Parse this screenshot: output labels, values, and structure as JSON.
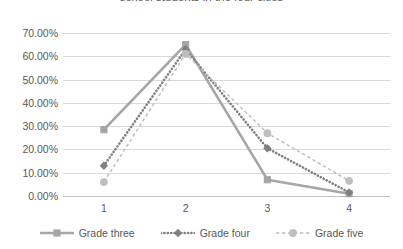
{
  "chart_data": {
    "type": "line",
    "title": "school students in the four cities",
    "xlabel": "",
    "ylabel": "",
    "categories": [
      "1",
      "2",
      "3",
      "4"
    ],
    "series": [
      {
        "name": "Grade three",
        "values": [
          28.5,
          65.0,
          7.0,
          1.0
        ],
        "color": "#a6a6a6",
        "dash": "solid",
        "marker": "square"
      },
      {
        "name": "Grade four",
        "values": [
          13.0,
          63.0,
          20.5,
          1.5
        ],
        "color": "#808080",
        "dash": "dotted",
        "marker": "diamond"
      },
      {
        "name": "Grade five",
        "values": [
          6.0,
          61.0,
          27.0,
          6.5
        ],
        "color": "#bfbfbf",
        "dash": "dashed",
        "marker": "circle"
      }
    ],
    "ylim": [
      0,
      70
    ],
    "ytick_labels": [
      "0.00%",
      "10.00%",
      "20.00%",
      "30.00%",
      "40.00%",
      "50.00%",
      "60.00%",
      "70.00%"
    ],
    "ytick_values": [
      0,
      10,
      20,
      30,
      40,
      50,
      60,
      70
    ],
    "grid": true,
    "legend_position": "bottom"
  },
  "colors": {
    "grid": "#d9d9d9",
    "axis": "#bfbfbf",
    "text": "#595959",
    "background": "#ffffff"
  }
}
